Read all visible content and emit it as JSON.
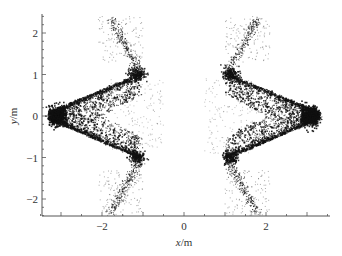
{
  "chart_data": {
    "type": "scatter",
    "title": "",
    "xlabel": "x/m",
    "ylabel": "y/m",
    "xlim": [
      -3.5,
      3.55
    ],
    "ylim": [
      -2.4,
      2.4
    ],
    "xticks": [
      -2,
      0,
      2
    ],
    "yticks": [
      -2,
      -1,
      0,
      1,
      2
    ],
    "xtick_labels": [
      "−2",
      "0",
      "2"
    ],
    "ytick_labels": [
      "−2",
      "−1",
      "0",
      "1",
      "2"
    ],
    "grid": false,
    "legend": null,
    "series": [
      {
        "name": "left-cloud",
        "tip": [
          -3.3,
          0.0
        ],
        "upper_edge": [
          [
            -3.3,
            0.0
          ],
          [
            -2.6,
            0.35
          ],
          [
            -1.8,
            0.6
          ],
          [
            -1.2,
            0.9
          ],
          [
            -1.05,
            1.1
          ]
        ],
        "lower_edge": [
          [
            -3.3,
            0.0
          ],
          [
            -2.6,
            -0.35
          ],
          [
            -1.8,
            -0.6
          ],
          [
            -1.2,
            -0.9
          ],
          [
            -1.05,
            -1.1
          ]
        ],
        "inner_edge": [
          [
            -1.0,
            0.5
          ],
          [
            -2.0,
            0.0
          ],
          [
            -1.0,
            -0.5
          ]
        ],
        "upper_streak": [
          [
            -1.05,
            1.1
          ],
          [
            -1.35,
            1.7
          ],
          [
            -1.8,
            2.35
          ]
        ],
        "lower_streak": [
          [
            -1.05,
            -1.1
          ],
          [
            -1.35,
            -1.7
          ],
          [
            -1.8,
            -2.35
          ]
        ]
      },
      {
        "name": "right-cloud",
        "tip": [
          3.3,
          0.0
        ],
        "upper_edge": [
          [
            3.3,
            0.0
          ],
          [
            2.6,
            0.35
          ],
          [
            1.8,
            0.6
          ],
          [
            1.2,
            0.9
          ],
          [
            1.05,
            1.1
          ]
        ],
        "lower_edge": [
          [
            3.3,
            0.0
          ],
          [
            2.6,
            -0.35
          ],
          [
            1.8,
            -0.6
          ],
          [
            1.2,
            -0.9
          ],
          [
            1.05,
            -1.1
          ]
        ],
        "inner_edge": [
          [
            1.0,
            0.5
          ],
          [
            2.0,
            0.0
          ],
          [
            1.0,
            -0.5
          ]
        ],
        "upper_streak": [
          [
            1.05,
            1.1
          ],
          [
            1.35,
            1.7
          ],
          [
            1.8,
            2.35
          ]
        ],
        "lower_streak": [
          [
            1.05,
            -1.1
          ],
          [
            1.35,
            -1.7
          ],
          [
            1.8,
            -2.35
          ]
        ]
      }
    ]
  },
  "axes": {
    "x_label_var": "x",
    "x_label_unit": "/m",
    "y_label_var": "y",
    "y_label_unit": "/m"
  }
}
